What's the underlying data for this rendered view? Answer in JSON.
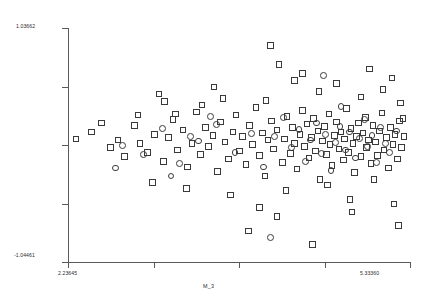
{
  "chart_data": {
    "type": "scatter",
    "title": "",
    "xlabel": "M_3",
    "ylabel": "",
    "xlim": [
      2.23645,
      5.3336
    ],
    "ylim": [
      -1.04461,
      1.03662
    ],
    "grid": false,
    "legend": "none",
    "x_tick_labels": [
      "2.23645",
      "5.33360"
    ],
    "y_tick_labels": [
      "1.03662",
      "-1.04461"
    ],
    "x_tick_count": 5,
    "y_tick_count": 5,
    "marker_colors": {
      "outline": "#3a3a3a",
      "fill": "none"
    },
    "axis_color": "#5a5a5a",
    "series": [
      {
        "name": "squares",
        "marker": "square",
        "points": [
          [
            2.3,
            0.06
          ],
          [
            2.44,
            0.12
          ],
          [
            2.53,
            0.2
          ],
          [
            2.61,
            -0.02
          ],
          [
            2.68,
            0.05
          ],
          [
            2.74,
            -0.1
          ],
          [
            2.83,
            0.18
          ],
          [
            2.88,
            0.02
          ],
          [
            2.95,
            -0.06
          ],
          [
            3.01,
            0.1
          ],
          [
            3.05,
            0.46
          ],
          [
            3.09,
            -0.14
          ],
          [
            3.14,
            0.07
          ],
          [
            3.18,
            0.23
          ],
          [
            3.22,
            -0.04
          ],
          [
            3.27,
            0.14
          ],
          [
            3.31,
            -0.19
          ],
          [
            3.35,
            0.02
          ],
          [
            3.39,
            0.3
          ],
          [
            3.43,
            -0.08
          ],
          [
            3.47,
            0.16
          ],
          [
            3.5,
            -0.01
          ],
          [
            3.54,
            0.09
          ],
          [
            3.58,
            -0.23
          ],
          [
            3.61,
            0.21
          ],
          [
            3.65,
            0.03
          ],
          [
            3.68,
            -0.12
          ],
          [
            3.72,
            0.12
          ],
          [
            3.75,
            0.27
          ],
          [
            3.78,
            -0.05
          ],
          [
            3.81,
            0.08
          ],
          [
            3.84,
            -0.17
          ],
          [
            3.87,
            0.18
          ],
          [
            3.9,
            0.01
          ],
          [
            3.93,
            0.34
          ],
          [
            3.96,
            -0.09
          ],
          [
            3.99,
            0.11
          ],
          [
            4.01,
            -0.27
          ],
          [
            4.04,
            0.05
          ],
          [
            4.07,
            0.22
          ],
          [
            4.09,
            -0.03
          ],
          [
            4.12,
            0.14
          ],
          [
            4.14,
            0.72
          ],
          [
            4.17,
            -0.15
          ],
          [
            4.19,
            0.06
          ],
          [
            4.21,
            0.26
          ],
          [
            4.24,
            -0.07
          ],
          [
            4.26,
            0.16
          ],
          [
            4.28,
            0.02
          ],
          [
            4.3,
            -0.21
          ],
          [
            4.33,
            0.1
          ],
          [
            4.35,
            0.31
          ],
          [
            4.37,
            -0.01
          ],
          [
            4.39,
            0.19
          ],
          [
            4.41,
            -0.11
          ],
          [
            4.43,
            0.07
          ],
          [
            4.45,
            0.24
          ],
          [
            4.47,
            -0.05
          ],
          [
            4.49,
            0.13
          ],
          [
            4.51,
            -0.3
          ],
          [
            4.53,
            0.04
          ],
          [
            4.55,
            0.17
          ],
          [
            4.57,
            -0.08
          ],
          [
            4.59,
            0.28
          ],
          [
            4.6,
            0.01
          ],
          [
            4.62,
            -0.18
          ],
          [
            4.64,
            0.09
          ],
          [
            4.66,
            0.21
          ],
          [
            4.68,
            -0.03
          ],
          [
            4.7,
            0.12
          ],
          [
            4.72,
            -0.13
          ],
          [
            4.73,
            0.06
          ],
          [
            4.75,
            0.33
          ],
          [
            4.77,
            -0.06
          ],
          [
            4.79,
            0.15
          ],
          [
            4.81,
            0.02
          ],
          [
            4.82,
            -0.24
          ],
          [
            4.84,
            0.08
          ],
          [
            4.86,
            0.2
          ],
          [
            4.88,
            -0.1
          ],
          [
            4.9,
            0.11
          ],
          [
            4.92,
            0.25
          ],
          [
            4.93,
            -0.02
          ],
          [
            4.95,
            0.05
          ],
          [
            4.97,
            -0.16
          ],
          [
            4.99,
            0.18
          ],
          [
            5.01,
            0.03
          ],
          [
            5.03,
            -0.09
          ],
          [
            5.05,
            0.13
          ],
          [
            5.07,
            0.29
          ],
          [
            5.09,
            -0.04
          ],
          [
            5.11,
            0.07
          ],
          [
            5.13,
            -0.2
          ],
          [
            5.15,
            0.16
          ],
          [
            5.17,
            0.01
          ],
          [
            5.19,
            0.1
          ],
          [
            5.21,
            -0.12
          ],
          [
            5.23,
            0.22
          ],
          [
            5.25,
            -0.02
          ],
          [
            5.27,
            0.08
          ],
          [
            4.06,
            0.89
          ],
          [
            4.35,
            0.64
          ],
          [
            4.66,
            0.55
          ],
          [
            4.88,
            0.43
          ],
          [
            5.16,
            0.6
          ],
          [
            5.24,
            0.38
          ],
          [
            3.96,
            -0.55
          ],
          [
            4.12,
            -0.63
          ],
          [
            4.78,
            -0.48
          ],
          [
            4.8,
            -0.59
          ],
          [
            5.18,
            -0.52
          ],
          [
            5.22,
            -0.71
          ],
          [
            3.86,
            -0.76
          ],
          [
            4.44,
            -0.88
          ],
          [
            3.1,
            0.39
          ],
          [
            3.44,
            0.36
          ],
          [
            2.99,
            -0.33
          ],
          [
            3.3,
            -0.38
          ],
          [
            3.63,
            0.42
          ],
          [
            4.02,
            0.4
          ],
          [
            4.5,
            0.48
          ],
          [
            5.08,
            0.5
          ],
          [
            3.2,
            0.28
          ],
          [
            2.86,
            0.27
          ],
          [
            4.2,
            -0.4
          ],
          [
            4.58,
            -0.35
          ],
          [
            5.0,
            -0.3
          ],
          [
            3.7,
            -0.44
          ],
          [
            3.55,
            0.52
          ],
          [
            4.28,
            0.58
          ],
          [
            4.96,
            0.68
          ],
          [
            5.26,
            0.24
          ]
        ]
      },
      {
        "name": "circles",
        "marker": "circle",
        "points": [
          [
            2.72,
            0.0
          ],
          [
            2.91,
            -0.08
          ],
          [
            3.08,
            0.15
          ],
          [
            3.24,
            -0.16
          ],
          [
            3.41,
            0.04
          ],
          [
            3.57,
            0.19
          ],
          [
            3.74,
            -0.06
          ],
          [
            3.89,
            0.11
          ],
          [
            4.0,
            -0.19
          ],
          [
            4.1,
            0.08
          ],
          [
            4.18,
            0.25
          ],
          [
            4.25,
            -0.02
          ],
          [
            4.32,
            0.14
          ],
          [
            4.38,
            -0.14
          ],
          [
            4.42,
            0.05
          ],
          [
            4.48,
            0.2
          ],
          [
            4.52,
            -0.07
          ],
          [
            4.56,
            0.1
          ],
          [
            4.61,
            -0.22
          ],
          [
            4.65,
            0.03
          ],
          [
            4.69,
            0.17
          ],
          [
            4.74,
            -0.04
          ],
          [
            4.78,
            0.12
          ],
          [
            4.83,
            -0.11
          ],
          [
            4.87,
            0.06
          ],
          [
            4.91,
            0.23
          ],
          [
            4.94,
            -0.01
          ],
          [
            4.98,
            0.09
          ],
          [
            5.02,
            -0.15
          ],
          [
            5.06,
            0.16
          ],
          [
            5.1,
            0.02
          ],
          [
            5.14,
            -0.06
          ],
          [
            5.2,
            0.13
          ],
          [
            2.66,
            -0.2
          ],
          [
            3.16,
            -0.27
          ],
          [
            3.52,
            0.26
          ],
          [
            4.54,
            0.62
          ],
          [
            4.06,
            -0.82
          ],
          [
            4.7,
            0.35
          ],
          [
            3.34,
            0.08
          ]
        ]
      }
    ]
  }
}
